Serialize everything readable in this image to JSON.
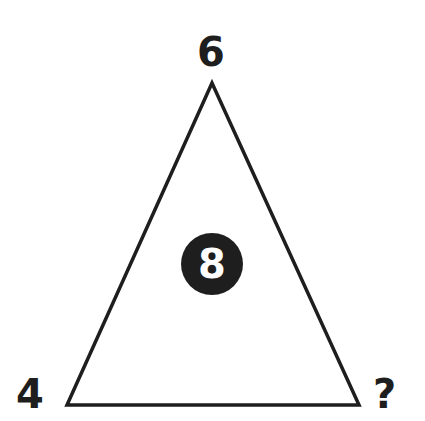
{
  "puzzle": {
    "top_value": "6",
    "left_value": "4",
    "right_value": "?",
    "center_value": "8"
  },
  "colors": {
    "stroke": "#1e1e1e",
    "background": "#ffffff",
    "circle_fill": "#1e1e1e",
    "circle_text": "#ffffff"
  }
}
